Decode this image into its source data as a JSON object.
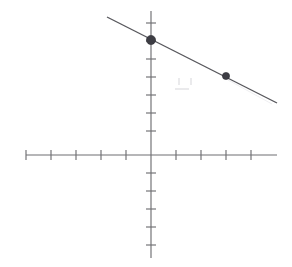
{
  "figure": {
    "kind": "line-graph-on-coordinate-plane",
    "background_color": "#ffffff",
    "axis_color": "#6e6e72",
    "line_color": "#57575c",
    "point_color": "#3d3d44",
    "title": "",
    "has_axis_labels": false,
    "has_tick_labels": false,
    "has_gridlines": false,
    "has_arrowheads": false
  },
  "axes": {
    "origin_px": {
      "x": 151,
      "y": 155
    },
    "x_axis": {
      "name": "x-axis",
      "start_px": 26,
      "end_px": 277,
      "y_px": 155,
      "tick_spacing_px": 25,
      "tick_positions_px": [
        26,
        51,
        76,
        101,
        126,
        176,
        201,
        226,
        251
      ],
      "tick_half_length_px": 5,
      "units_left_of_origin": 5,
      "units_right_of_origin": 5
    },
    "y_axis": {
      "name": "y-axis",
      "start_px": 11,
      "end_px": 258,
      "x_px": 151,
      "tick_spacing_px": 18,
      "tick_positions_px": [
        23,
        41,
        59,
        77,
        95,
        113,
        131,
        173,
        191,
        209,
        227,
        245
      ],
      "tick_half_length_px": 5,
      "units_above_origin": 8,
      "units_below_origin": 5
    }
  },
  "chart_data": {
    "type": "line",
    "title": "",
    "xlabel": "",
    "ylabel": "",
    "xlim": [
      -5,
      5
    ],
    "ylim": [
      -5,
      8
    ],
    "grid": false,
    "legend": "none",
    "equation": "y = -2/3 x + 6.4",
    "slope": -0.6667,
    "y_intercept": 6.4,
    "series": [
      {
        "name": "plotted line",
        "kind": "line-segment",
        "endpoints": [
          {
            "x": -1.75,
            "y": 7.6
          },
          {
            "x": 5.05,
            "y": 3.05
          }
        ],
        "endpoints_px": [
          {
            "x": 107,
            "y": 17
          },
          {
            "x": 277,
            "y": 103
          }
        ]
      },
      {
        "name": "marked points",
        "kind": "scatter",
        "points": [
          {
            "x": 0,
            "y": 6.4,
            "px": {
              "x": 151,
              "y": 40
            },
            "radius_px": 4.6,
            "label": ""
          },
          {
            "x": 3,
            "y": 4.4,
            "px": {
              "x": 226,
              "y": 76
            },
            "radius_px": 3.6,
            "label": ""
          }
        ]
      }
    ]
  },
  "artifacts": {
    "description": "faint scan smudges",
    "marks_px": [
      {
        "x": 178,
        "y": 78,
        "w": 2,
        "h": 7
      },
      {
        "x": 190,
        "y": 78,
        "w": 2,
        "h": 7
      },
      {
        "x": 175,
        "y": 88,
        "w": 14,
        "h": 2
      }
    ]
  }
}
